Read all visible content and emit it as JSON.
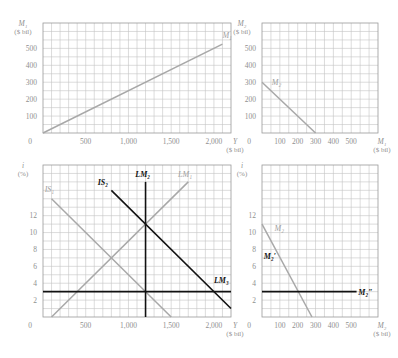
{
  "colors": {
    "gray_line": "#a8a8a8",
    "black_line": "#111111",
    "grid": "#c4c4c4",
    "frame": "#9a9a9a",
    "text": "#8f8f8f"
  },
  "chart_data": [
    {
      "id": "top-left",
      "type": "line",
      "title": "",
      "ylabel": "M₁",
      "yunit": "($ bil)",
      "xlabel": "Y",
      "xunit": "($ bil)",
      "xlim": [
        0,
        2200
      ],
      "ylim": [
        0,
        650
      ],
      "grid": true,
      "x_ticks": [
        {
          "v": 500,
          "label": "500"
        },
        {
          "v": 1000,
          "label": "1,000"
        },
        {
          "v": 1500,
          "label": "1,500"
        },
        {
          "v": 2000,
          "label": "2,000"
        }
      ],
      "y_ticks": [
        {
          "v": 100,
          "label": "100"
        },
        {
          "v": 200,
          "label": "200"
        },
        {
          "v": 300,
          "label": "300"
        },
        {
          "v": 400,
          "label": "400"
        },
        {
          "v": 500,
          "label": "500"
        }
      ],
      "origin_label": "0",
      "x_grid_step": 100,
      "y_grid_step": 50,
      "series": [
        {
          "name": "M₁",
          "color": "gray",
          "points": [
            [
              0,
              0
            ],
            [
              2100,
              525
            ]
          ],
          "label_at": [
            2100,
            560
          ]
        }
      ]
    },
    {
      "id": "top-right",
      "type": "line",
      "title": "",
      "ylabel": "M₂",
      "yunit": "($ bil)",
      "xlabel": "M₁",
      "xunit": "($ bil)",
      "xlim": [
        0,
        650
      ],
      "ylim": [
        0,
        650
      ],
      "grid": true,
      "x_ticks": [
        {
          "v": 100,
          "label": "100"
        },
        {
          "v": 200,
          "label": "200"
        },
        {
          "v": 300,
          "label": "300"
        },
        {
          "v": 400,
          "label": "400"
        },
        {
          "v": 500,
          "label": "500"
        }
      ],
      "y_ticks": [
        {
          "v": 100,
          "label": "100"
        },
        {
          "v": 200,
          "label": "200"
        },
        {
          "v": 300,
          "label": "300"
        },
        {
          "v": 400,
          "label": "400"
        },
        {
          "v": 500,
          "label": "500"
        }
      ],
      "origin_label": "0",
      "x_grid_step": 50,
      "y_grid_step": 50,
      "series": [
        {
          "name": "M₂",
          "color": "gray",
          "points": [
            [
              0,
              300
            ],
            [
              300,
              0
            ]
          ],
          "label_at": [
            55,
            285
          ]
        }
      ]
    },
    {
      "id": "bottom-left",
      "type": "line",
      "title": "",
      "ylabel": "i",
      "yunit": "(%)",
      "xlabel": "Y",
      "xunit": "($ bil)",
      "xlim": [
        0,
        2200
      ],
      "ylim": [
        0,
        18
      ],
      "grid": true,
      "x_ticks": [
        {
          "v": 500,
          "label": "500"
        },
        {
          "v": 1000,
          "label": "1,000"
        },
        {
          "v": 1500,
          "label": "1,500"
        },
        {
          "v": 2000,
          "label": "2,000"
        }
      ],
      "y_ticks": [
        {
          "v": 2,
          "label": "2"
        },
        {
          "v": 4,
          "label": "4"
        },
        {
          "v": 6,
          "label": "6"
        },
        {
          "v": 8,
          "label": "8"
        },
        {
          "v": 10,
          "label": "10"
        },
        {
          "v": 12,
          "label": "12"
        }
      ],
      "origin_label": "0",
      "x_grid_step": 100,
      "y_grid_step": 1,
      "series": [
        {
          "name": "IS₁",
          "color": "gray",
          "points": [
            [
              100,
              14
            ],
            [
              1500,
              0
            ]
          ],
          "label_at": [
            20,
            14.8
          ]
        },
        {
          "name": "LM₁",
          "color": "gray",
          "points": [
            [
              100,
              0
            ],
            [
              1700,
              16
            ]
          ],
          "label_at": [
            1580,
            16.6
          ]
        },
        {
          "name": "IS₂",
          "color": "black",
          "points": [
            [
              800,
              15
            ],
            [
              2200,
              1
            ]
          ],
          "label_at": [
            640,
            15.6
          ]
        },
        {
          "name": "LM₂",
          "color": "black",
          "points": [
            [
              1200,
              0
            ],
            [
              1200,
              16
            ]
          ],
          "label_at": [
            1080,
            16.6
          ]
        },
        {
          "name": "LM₃",
          "color": "black",
          "points": [
            [
              0,
              3
            ],
            [
              2200,
              3
            ]
          ],
          "label_at": [
            2000,
            4
          ]
        }
      ]
    },
    {
      "id": "bottom-right",
      "type": "line",
      "title": "",
      "ylabel": "i",
      "yunit": "(%)",
      "xlabel": "M₂",
      "xunit": "($ bil)",
      "xlim": [
        0,
        650
      ],
      "ylim": [
        0,
        18
      ],
      "grid": true,
      "x_ticks": [
        {
          "v": 100,
          "label": "100"
        },
        {
          "v": 200,
          "label": "200"
        },
        {
          "v": 300,
          "label": "300"
        },
        {
          "v": 400,
          "label": "400"
        },
        {
          "v": 500,
          "label": "500"
        }
      ],
      "y_ticks": [
        {
          "v": 2,
          "label": "2"
        },
        {
          "v": 4,
          "label": "4"
        },
        {
          "v": 6,
          "label": "6"
        },
        {
          "v": 8,
          "label": "8"
        },
        {
          "v": 10,
          "label": "10"
        },
        {
          "v": 12,
          "label": "12"
        }
      ],
      "origin_label": "0",
      "x_grid_step": 50,
      "y_grid_step": 1,
      "series": [
        {
          "name": "M₂",
          "color": "gray",
          "points": [
            [
              0,
              11
            ],
            [
              280,
              0
            ]
          ],
          "label_at": [
            70,
            10.2
          ]
        },
        {
          "name": "M₂′",
          "color": "black",
          "points": [],
          "label_at": [
            10,
            6.9
          ]
        },
        {
          "name": "M₂″",
          "color": "black",
          "points": [
            [
              0,
              3
            ],
            [
              530,
              3
            ]
          ],
          "label_at": [
            540,
            2.6
          ]
        }
      ]
    }
  ]
}
